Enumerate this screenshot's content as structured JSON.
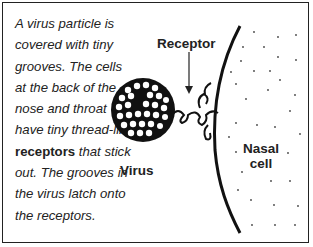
{
  "caption": {
    "part1": "A virus particle is covered with tiny grooves. The cells at the back of the nose and throat have tiny thread-like ",
    "bold": "receptors",
    "part2": " that stick out. The grooves in the virus latch onto the receptors."
  },
  "labels": {
    "receptor": "Receptor",
    "virus": "Virus",
    "nasal_line1": "Nasal",
    "nasal_line2": "cell"
  },
  "colors": {
    "ink": "#222222",
    "background": "#ffffff"
  }
}
